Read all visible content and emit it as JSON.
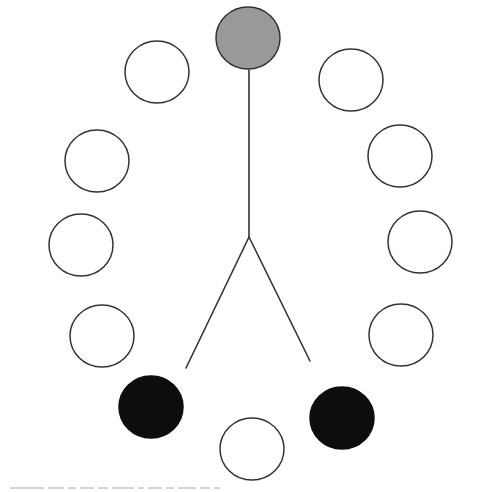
{
  "figure": {
    "stroke_color": "#333333",
    "colors": {
      "white": "#ffffff",
      "gray": "#999999",
      "black": "#0d0d0d"
    },
    "figure_lines": {
      "stem": {
        "x1": 249,
        "y1": 70,
        "x2": 249,
        "y2": 237
      },
      "left_leg": {
        "x1": 249,
        "y1": 237,
        "x2": 186,
        "y2": 368
      },
      "right_leg": {
        "x1": 249,
        "y1": 237,
        "x2": 310,
        "y2": 361
      }
    },
    "circles": [
      {
        "id": "top-head",
        "cx": 248,
        "cy": 38,
        "r": 32,
        "fill": "gray"
      },
      {
        "id": "right-1",
        "cx": 351,
        "cy": 80,
        "r": 32,
        "fill": "white"
      },
      {
        "id": "right-2",
        "cx": 400,
        "cy": 156,
        "r": 32,
        "fill": "white"
      },
      {
        "id": "right-3",
        "cx": 420,
        "cy": 242,
        "r": 32,
        "fill": "white"
      },
      {
        "id": "right-4",
        "cx": 401,
        "cy": 335,
        "r": 32,
        "fill": "white"
      },
      {
        "id": "bottom-right",
        "cx": 342,
        "cy": 418,
        "r": 32,
        "fill": "black"
      },
      {
        "id": "bottom",
        "cx": 252,
        "cy": 449,
        "r": 32,
        "fill": "white"
      },
      {
        "id": "bottom-left",
        "cx": 151,
        "cy": 407,
        "r": 32,
        "fill": "black"
      },
      {
        "id": "left-4",
        "cx": 102,
        "cy": 336,
        "r": 32,
        "fill": "white"
      },
      {
        "id": "left-3",
        "cx": 81,
        "cy": 245,
        "r": 32,
        "fill": "white"
      },
      {
        "id": "left-2",
        "cx": 97,
        "cy": 161,
        "r": 32,
        "fill": "white"
      },
      {
        "id": "left-1",
        "cx": 157,
        "cy": 72,
        "r": 32,
        "fill": "white"
      }
    ]
  },
  "caption": {
    "visible": "truncated",
    "segments": [
      34,
      16,
      8,
      14,
      10,
      22,
      6,
      14,
      8,
      18,
      10,
      6
    ]
  }
}
